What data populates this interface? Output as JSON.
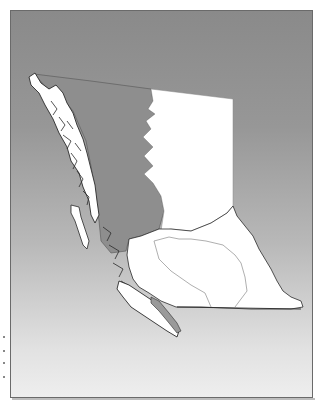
{
  "map": {
    "subject": "British Columbia regional map",
    "highlighted_region": "north-central coastal region",
    "colors": {
      "background_top": "#8a8a8a",
      "background_bottom": "#eeeeee",
      "highlight_fill": "#8e8e8e",
      "land_fill": "#ffffff",
      "coast_outline": "#2a2a2a",
      "internal_border": "#9a9a9a",
      "frame_border": "#6a6a6a"
    },
    "regions": [
      {
        "id": "northwest-coast",
        "shaded": false
      },
      {
        "id": "north-central",
        "shaded": true
      },
      {
        "id": "northeast",
        "shaded": false
      },
      {
        "id": "central-interior",
        "shaded": false
      },
      {
        "id": "southern-interior",
        "shaded": false
      },
      {
        "id": "kootenay",
        "shaded": false
      },
      {
        "id": "vancouver-island",
        "shaded": false
      },
      {
        "id": "haida-gwaii",
        "shaded": false
      }
    ]
  }
}
